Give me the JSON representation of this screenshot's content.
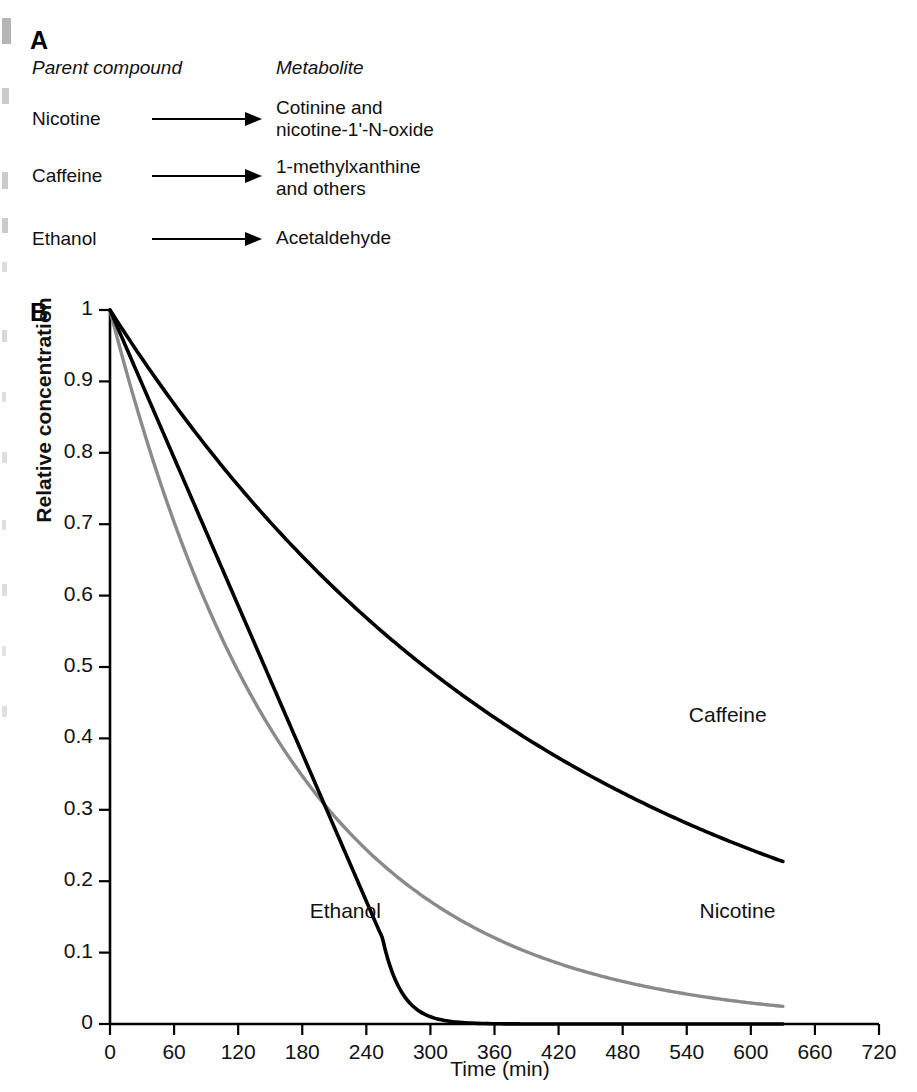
{
  "figure": {
    "panels": [
      {
        "letter": "A"
      },
      {
        "letter": "B"
      }
    ]
  },
  "panel_a": {
    "letter": "A",
    "headers": {
      "parent": "Parent compound",
      "metabolite": "Metabolite"
    },
    "rows": [
      {
        "parent": "Nicotine",
        "arrow": "right-arrow",
        "metabolite": "Cotinine and\nnicotine-1'-N-oxide"
      },
      {
        "parent": "Caffeine",
        "arrow": "right-arrow",
        "metabolite": "1-methylxanthine\nand others"
      },
      {
        "parent": "Ethanol",
        "arrow": "right-arrow",
        "metabolite": "Acetaldehyde"
      }
    ]
  },
  "panel_b": {
    "letter": "B",
    "axis_title_y": "Relative concentration",
    "axis_title_x": "Time (min)"
  },
  "chart_data": {
    "type": "line",
    "title": "",
    "xlabel": "Time (min)",
    "ylabel": "Relative concentration",
    "xlim": [
      0,
      720
    ],
    "ylim": [
      0,
      1
    ],
    "xticks": [
      0,
      60,
      120,
      180,
      240,
      300,
      360,
      420,
      480,
      540,
      600,
      660,
      720
    ],
    "yticks": [
      0,
      0.1,
      0.2,
      0.3,
      0.4,
      0.5,
      0.6,
      0.7,
      0.8,
      0.9,
      1
    ],
    "xtick_labels": [
      "0",
      "60",
      "120",
      "180",
      "240",
      "300",
      "360",
      "420",
      "480",
      "540",
      "600",
      "660",
      "720"
    ],
    "ytick_labels": [
      "0",
      "0.1",
      "0.2",
      "0.3",
      "0.4",
      "0.5",
      "0.6",
      "0.7",
      "0.8",
      "0.9",
      "1"
    ],
    "grid": false,
    "legend": "inline-labels",
    "annotations": [
      {
        "text": "Caffeine",
        "x": 570,
        "y": 0.43
      },
      {
        "text": "Nicotine",
        "x": 580,
        "y": 0.155
      },
      {
        "text": "Ethanol",
        "x": 215,
        "y": 0.155
      }
    ],
    "series": [
      {
        "name": "Caffeine",
        "color": "#000000",
        "kinetics": "first-order",
        "half_life_min": 295,
        "x": [
          0,
          60,
          120,
          180,
          240,
          300,
          360,
          420,
          480,
          540,
          600,
          630
        ],
        "values": [
          1.0,
          0.87,
          0.755,
          0.657,
          0.571,
          0.496,
          0.431,
          0.375,
          0.326,
          0.283,
          0.246,
          0.229
        ]
      },
      {
        "name": "Nicotine",
        "color": "#8a8a8a",
        "kinetics": "first-order",
        "half_life_min": 118,
        "x": [
          0,
          60,
          120,
          180,
          240,
          300,
          360,
          420,
          480,
          540,
          600,
          630
        ],
        "values": [
          1.0,
          0.702,
          0.493,
          0.346,
          0.243,
          0.171,
          0.12,
          0.084,
          0.059,
          0.041,
          0.029,
          0.024
        ]
      },
      {
        "name": "Ethanol",
        "color": "#000000",
        "kinetics": "zero-order-then-first-order",
        "zero_order_rate_per_min": 0.00345,
        "depletion_time_min": 290,
        "x": [
          0,
          60,
          120,
          180,
          240,
          260,
          275,
          290,
          305,
          330,
          360,
          480,
          630
        ],
        "values": [
          1.0,
          0.793,
          0.586,
          0.379,
          0.172,
          0.103,
          0.058,
          0.027,
          0.013,
          0.005,
          0.002,
          0.0,
          0.0
        ]
      }
    ]
  }
}
